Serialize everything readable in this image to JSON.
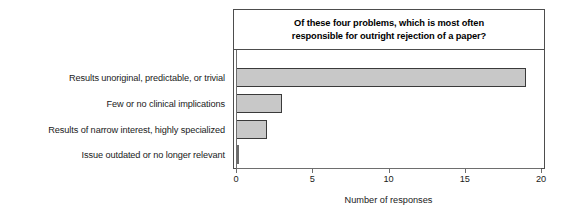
{
  "chart_data": {
    "type": "bar",
    "orientation": "horizontal",
    "title": "Of these four problems, which is most often responsible for outright rejection of a paper?",
    "title_lines": [
      "Of these four problems, which is most often",
      "responsible for outright rejection of a paper?"
    ],
    "categories": [
      "Results unoriginal, predictable, or trivial",
      "Few or no clinical implications",
      "Results of narrow interest, highly specialized",
      "Issue outdated or no longer relevant"
    ],
    "values": [
      19,
      3,
      2,
      0.1
    ],
    "xlabel": "Number of responses",
    "ylabel": "",
    "xlim": [
      0,
      20
    ],
    "xticks": [
      0,
      5,
      10,
      15,
      20
    ],
    "xtick_labels": [
      "0",
      "5",
      "10",
      "15",
      "20"
    ],
    "grid": false,
    "legend": false,
    "bar_fill_color": "#c8c8c8",
    "bar_edge_color": "#3a3a3a",
    "frame_color": "#4d4d4d",
    "background_color": "#ffffff",
    "text_color": "#1a1a1a"
  }
}
